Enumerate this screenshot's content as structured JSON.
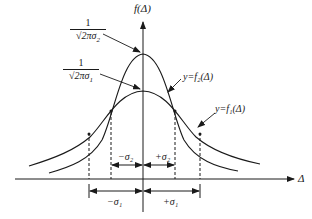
{
  "diagram": {
    "title": "",
    "y_axis_label": "f(Δ)",
    "x_axis_label": "Δ",
    "peak_labels": {
      "f2_peak": {
        "numerator": "1",
        "sqrt": "√",
        "denominator": "2πσ",
        "subscript": "2"
      },
      "f1_peak": {
        "numerator": "1",
        "sqrt": "√",
        "denominator": "2πσ",
        "subscript": "1"
      }
    },
    "curve_labels": {
      "f2": "y=f₂(Δ)",
      "f1": "y=f₁(Δ)"
    },
    "interval_labels": {
      "minus_sigma2": "−σ₂",
      "plus_sigma2": "+σ₂",
      "minus_sigma1": "−σ₁",
      "plus_sigma1": "+σ₁"
    },
    "curves": [
      {
        "name": "f2",
        "description": "narrow normal curve, larger peak",
        "sigma": "σ₂"
      },
      {
        "name": "f1",
        "description": "wide normal curve, smaller peak",
        "sigma": "σ₁"
      }
    ],
    "colors": {
      "stroke": "#1a1a1a",
      "background": "#ffffff"
    }
  }
}
